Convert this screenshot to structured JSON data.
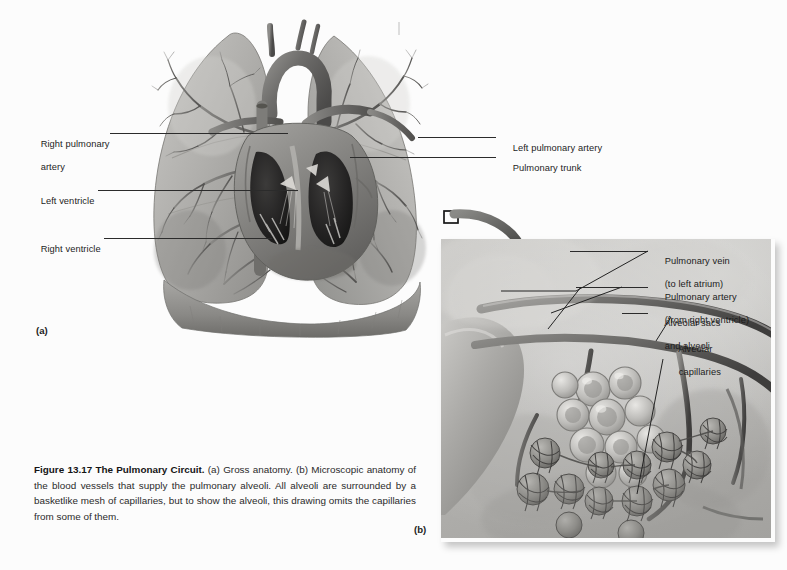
{
  "figure": {
    "number": "13.17",
    "caption_bold": "Figure 13.17 The Pulmonary Circuit.",
    "caption_rest": " (a) Gross anatomy. (b) Microscopic anatomy of the blood vessels that supply the pulmonary alveoli. All alveoli are surrounded by a basketlike mesh of capillaries, but to show the alveoli, this drawing omits the capillaries from some of them."
  },
  "panels": {
    "a": {
      "letter": "(a)",
      "title": "Gross anatomy"
    },
    "b": {
      "letter": "(b)",
      "title": "Microscopic anatomy"
    }
  },
  "labels_left": [
    {
      "line1": "Right pulmonary",
      "line2": "artery"
    },
    {
      "line1": "Left ventricle",
      "line2": ""
    },
    {
      "line1": "Right ventricle",
      "line2": ""
    }
  ],
  "labels_right": [
    {
      "line1": "Left pulmonary artery",
      "line2": ""
    },
    {
      "line1": "Pulmonary trunk",
      "line2": ""
    }
  ],
  "labels_inset": [
    {
      "line1": "Pulmonary vein",
      "line2": "(to left atrium)"
    },
    {
      "line1": "Pulmonary artery",
      "line2": "(from right ventricle)"
    },
    {
      "line1": "Alveolar sacs",
      "line2": "and alveoli"
    },
    {
      "line1": "Alveolar",
      "line2": "capillaries"
    }
  ],
  "colors": {
    "background": "#fcfcfc",
    "text": "#1c1c1c",
    "leader": "#2b2b2b",
    "inset_bg": "#b9b9b7",
    "tissue_mid": "#9a9a97",
    "tissue_dark": "#4a4a48"
  }
}
